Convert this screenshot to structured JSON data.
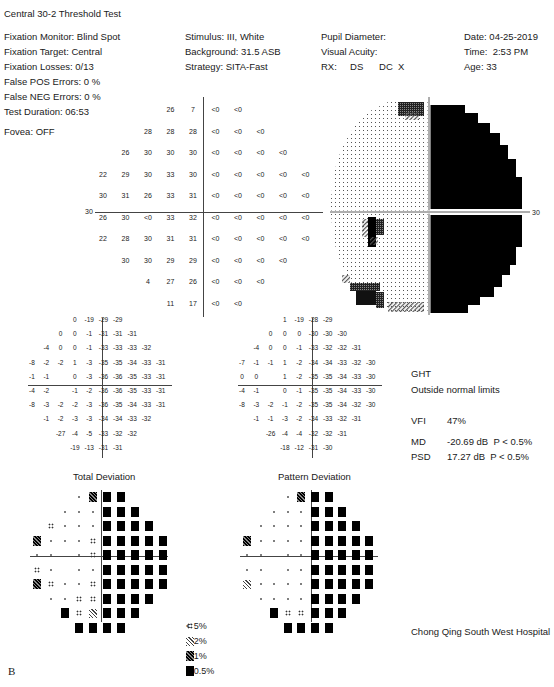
{
  "header": {
    "title": "Central 30-2 Threshold Test",
    "left": [
      "Fixation Monitor: Blind Spot",
      "Fixation Target: Central",
      "Fixation Losses: 0/13",
      "False POS Errors:  0 %",
      "False NEG Errors:  0 %",
      "Test Duration: 06:53"
    ],
    "fovea": "Fovea: OFF",
    "middle": [
      "Stimulus: III, White",
      "Background: 31.5 ASB",
      "Strategy: SITA-Fast"
    ],
    "right_mid": [
      "Pupil Diameter:",
      "Visual Acuity:",
      "RX:     DS      DC  X"
    ],
    "right": [
      "Date: 04-25-2019",
      "Time:  2:53 PM",
      "Age: 33"
    ]
  },
  "threshold_plot": {
    "axis_label_left": "30",
    "axis_label_right": "30",
    "rows": [
      [
        "",
        "",
        "",
        "26",
        "7",
        "<0",
        "<0",
        "",
        "",
        ""
      ],
      [
        "",
        "",
        "28",
        "28",
        "28",
        "<0",
        "<0",
        "<0",
        "",
        ""
      ],
      [
        "",
        "26",
        "30",
        "30",
        "30",
        "<0",
        "<0",
        "<0",
        "<0",
        ""
      ],
      [
        "22",
        "29",
        "30",
        "33",
        "30",
        "<0",
        "<0",
        "<0",
        "<0",
        "<0"
      ],
      [
        "30",
        "31",
        "26",
        "33",
        "31",
        "<0",
        "<0",
        "<0",
        "<0",
        "<0"
      ],
      [
        "26",
        "30",
        "<0",
        "33",
        "32",
        "<0",
        "<0",
        "<0",
        "<0",
        "<0"
      ],
      [
        "22",
        "28",
        "30",
        "31",
        "31",
        "<0",
        "<0",
        "<0",
        "<0",
        "<0"
      ],
      [
        "",
        "30",
        "30",
        "29",
        "29",
        "<0",
        "<0",
        "<0",
        "<0",
        ""
      ],
      [
        "",
        "",
        "4",
        "27",
        "26",
        "<0",
        "<0",
        "<0",
        "",
        ""
      ],
      [
        "",
        "",
        "",
        "11",
        "17",
        "<0",
        "<0",
        "",
        "",
        ""
      ]
    ]
  },
  "total_deviation": {
    "title": "Total Deviation",
    "rows": [
      [
        "",
        "",
        "",
        "0",
        "-19",
        "-29",
        "-29",
        "",
        "",
        ""
      ],
      [
        "",
        "",
        "0",
        "0",
        "-1",
        "-31",
        "-31",
        "-31",
        "",
        ""
      ],
      [
        "",
        "-4",
        "0",
        "0",
        "-1",
        "-33",
        "-33",
        "-33",
        "-32",
        ""
      ],
      [
        "-8",
        "-2",
        "-2",
        "1",
        "-3",
        "-35",
        "-35",
        "-34",
        "-33",
        "-31"
      ],
      [
        "-1",
        "-1",
        "",
        "0",
        "-3",
        "-36",
        "-36",
        "-35",
        "-33",
        "-31"
      ],
      [
        "-4",
        "-2",
        "",
        "-1",
        "-2",
        "-36",
        "-36",
        "-35",
        "-33",
        "-31"
      ],
      [
        "-8",
        "-3",
        "-2",
        "-2",
        "-3",
        "-36",
        "-35",
        "-34",
        "-33",
        "-31"
      ],
      [
        "",
        "-1",
        "-2",
        "-3",
        "-3",
        "-34",
        "-34",
        "-33",
        "-32",
        ""
      ],
      [
        "",
        "",
        "-27",
        "-4",
        "-5",
        "-33",
        "-32",
        "-32",
        "",
        ""
      ],
      [
        "",
        "",
        "",
        "-19",
        "-13",
        "-31",
        "-31",
        "",
        "",
        ""
      ]
    ],
    "prob_rows": [
      [
        "",
        "",
        "",
        "n",
        "p1",
        "b",
        "b",
        "",
        "",
        ""
      ],
      [
        "",
        "",
        "n",
        "n",
        "n",
        "b",
        "b",
        "b",
        "",
        ""
      ],
      [
        "",
        "p5",
        "n",
        "n",
        "n",
        "b",
        "b",
        "b",
        "b",
        ""
      ],
      [
        "p1",
        "n",
        "n",
        "n",
        "p5",
        "b",
        "b",
        "b",
        "b",
        "b"
      ],
      [
        "n",
        "n",
        "",
        "n",
        "p5",
        "b",
        "b",
        "b",
        "b",
        "b"
      ],
      [
        "p5",
        "n",
        "",
        "n",
        "n",
        "b",
        "b",
        "b",
        "b",
        "b"
      ],
      [
        "p1",
        "p5",
        "n",
        "n",
        "p5",
        "b",
        "b",
        "b",
        "b",
        "b"
      ],
      [
        "",
        "n",
        "n",
        "p5",
        "p5",
        "b",
        "b",
        "b",
        "b",
        ""
      ],
      [
        "",
        "",
        "b",
        "p5",
        "p2",
        "b",
        "b",
        "b",
        "",
        ""
      ],
      [
        "",
        "",
        "",
        "b",
        "b",
        "b",
        "b",
        "",
        "",
        ""
      ]
    ]
  },
  "pattern_deviation": {
    "title": "Pattern Deviation",
    "rows": [
      [
        "",
        "",
        "",
        "1",
        "-19",
        "-28",
        "-29",
        "",
        "",
        ""
      ],
      [
        "",
        "",
        "0",
        "0",
        "0",
        "-30",
        "-30",
        "-30",
        "",
        ""
      ],
      [
        "",
        "-4",
        "0",
        "0",
        "-1",
        "-33",
        "-32",
        "-32",
        "-31",
        ""
      ],
      [
        "-7",
        "-1",
        "-1",
        "1",
        "-2",
        "-34",
        "-34",
        "-33",
        "-32",
        "-30"
      ],
      [
        "0",
        "0",
        "",
        "1",
        "-2",
        "-35",
        "-35",
        "-34",
        "-33",
        "-30"
      ],
      [
        "-4",
        "-1",
        "",
        "0",
        "-1",
        "-35",
        "-35",
        "-34",
        "-33",
        "-30"
      ],
      [
        "-8",
        "-3",
        "-2",
        "-1",
        "-2",
        "-35",
        "-35",
        "-34",
        "-32",
        "-30"
      ],
      [
        "",
        "-1",
        "-1",
        "-3",
        "-2",
        "-34",
        "-33",
        "-32",
        "-31",
        ""
      ],
      [
        "",
        "",
        "-26",
        "-4",
        "-4",
        "-32",
        "-32",
        "-31",
        "",
        ""
      ],
      [
        "",
        "",
        "",
        "-18",
        "-12",
        "-31",
        "-30",
        "",
        "",
        ""
      ]
    ],
    "prob_rows": [
      [
        "",
        "",
        "",
        "n",
        "p1",
        "b",
        "b",
        "",
        "",
        ""
      ],
      [
        "",
        "",
        "n",
        "n",
        "n",
        "b",
        "b",
        "b",
        "",
        ""
      ],
      [
        "",
        "n",
        "n",
        "n",
        "n",
        "b",
        "b",
        "b",
        "b",
        ""
      ],
      [
        "p1",
        "n",
        "n",
        "n",
        "n",
        "b",
        "b",
        "b",
        "b",
        "b"
      ],
      [
        "n",
        "n",
        "",
        "n",
        "n",
        "b",
        "b",
        "b",
        "b",
        "b"
      ],
      [
        "n",
        "n",
        "",
        "n",
        "n",
        "b",
        "b",
        "b",
        "b",
        "b"
      ],
      [
        "p2",
        "n",
        "n",
        "n",
        "n",
        "b",
        "b",
        "b",
        "b",
        "b"
      ],
      [
        "",
        "n",
        "n",
        "n",
        "n",
        "b",
        "b",
        "b",
        "b",
        ""
      ],
      [
        "",
        "",
        "b",
        "p5",
        "p5",
        "b",
        "b",
        "b",
        "",
        ""
      ],
      [
        "",
        "",
        "",
        "b",
        "b",
        "b",
        "b",
        "",
        "",
        ""
      ]
    ]
  },
  "indices": {
    "ght_label": "GHT",
    "ght_value": "Outside normal limits",
    "vfi_label": "VFI",
    "vfi_value": "47%",
    "md_label": "MD",
    "md_value": "-20.69 dB  P < 0.5%",
    "psd_label": "PSD",
    "psd_value": "17.27 dB  P < 0.5%"
  },
  "legend": [
    {
      "symbol": "p5",
      "label": "< 5%"
    },
    {
      "symbol": "p2",
      "label": "< 2%"
    },
    {
      "symbol": "p1",
      "label": "< 1%"
    },
    {
      "symbol": "b",
      "label": "< 0.5%"
    }
  ],
  "footer": {
    "hospital": "Chong Qing South West Hospital",
    "panel_label": "B"
  }
}
